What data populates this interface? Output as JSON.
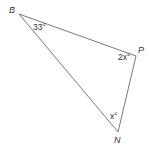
{
  "diagram": {
    "type": "triangle",
    "vertices": {
      "B": {
        "label": "B",
        "x": 19,
        "y": 14
      },
      "P": {
        "label": "P",
        "x": 136,
        "y": 56
      },
      "N": {
        "label": "N",
        "x": 118,
        "y": 132
      }
    },
    "angles": {
      "B": "33°",
      "P": "2x°",
      "N": "x°"
    },
    "colors": {
      "line": "#6a6a6a",
      "text": "#333333",
      "background": "#ffffff"
    }
  }
}
